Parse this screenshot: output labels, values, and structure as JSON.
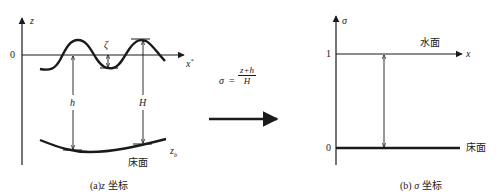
{
  "panel_a": {
    "axis_z_label": "z",
    "axis_x_label": "x",
    "axis_x_sup": "*",
    "origin_label": "0",
    "zeta_label": "ζ",
    "h_label": "h",
    "H_label": "H",
    "zb_label": "z",
    "zb_sub": "b",
    "bed_label": "床面",
    "caption_prefix": "(a)",
    "caption_var": "z",
    "caption_suffix": " 坐标"
  },
  "transform": {
    "sigma": "σ",
    "equals": "=",
    "numerator": "z+h",
    "denominator": "H"
  },
  "panel_b": {
    "axis_sigma_label": "σ",
    "axis_x_label": "x",
    "tick_1": "1",
    "tick_0": "0",
    "surface_label": "水面",
    "bed_label": "床面",
    "caption_prefix": "(b)",
    "caption_var": " σ",
    "caption_suffix": " 坐标"
  },
  "colors": {
    "ink": "#1a1a1a",
    "background": "#ffffff"
  }
}
